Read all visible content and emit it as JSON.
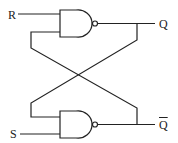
{
  "diagram": {
    "type": "SR latch (cross-coupled NAND gates)",
    "inputs": {
      "top": "R",
      "bottom": "S"
    },
    "outputs": {
      "top": "Q",
      "bottom": "Q",
      "bottom_note": "Q with overbar (Q-bar)"
    },
    "colors": {
      "line": "#222222",
      "background": "#ffffff"
    }
  }
}
